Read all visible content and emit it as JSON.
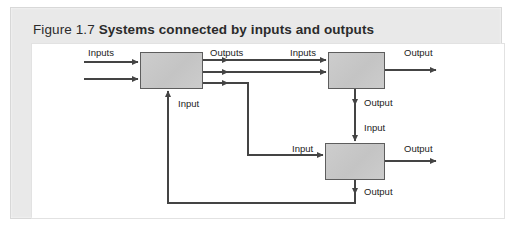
{
  "figure": {
    "number": "Figure 1.7",
    "title": "Systems connected by inputs and outputs",
    "caption_full": "Figure 1.7  Systems connected by inputs and outputs"
  },
  "colors": {
    "panel_background": "#e9e9e9",
    "canvas_background": "#ffffff",
    "box_fill": "#c9c9c9",
    "box_stroke": "#5d5d5d",
    "line_stroke": "#444444",
    "text": "#222222"
  },
  "diagram": {
    "type": "block-flow",
    "nodes": [
      {
        "id": "system-1",
        "label": "",
        "x": 140,
        "y": 52,
        "width": 63,
        "height": 37
      },
      {
        "id": "system-2",
        "label": "",
        "x": 328,
        "y": 52,
        "width": 57,
        "height": 37
      },
      {
        "id": "system-3",
        "label": "",
        "x": 325,
        "y": 143,
        "width": 60,
        "height": 37
      }
    ],
    "labels": [
      {
        "id": "label-inputs-system1",
        "text": "Inputs",
        "x": 88,
        "y": 47
      },
      {
        "id": "label-outputs-system1",
        "text": "Outputs",
        "x": 210,
        "y": 47
      },
      {
        "id": "label-input-system1-bottom",
        "text": "Input",
        "x": 178,
        "y": 98
      },
      {
        "id": "label-inputs-system2",
        "text": "Inputs",
        "x": 290,
        "y": 47
      },
      {
        "id": "label-output-system2-right",
        "text": "Output",
        "x": 404,
        "y": 47
      },
      {
        "id": "label-output-system2-bottom",
        "text": "Output",
        "x": 364,
        "y": 97
      },
      {
        "id": "label-input-system3-top",
        "text": "Input",
        "x": 364,
        "y": 122
      },
      {
        "id": "label-input-system3-left",
        "text": "Input",
        "x": 292,
        "y": 143
      },
      {
        "id": "label-output-system3-right",
        "text": "Output",
        "x": 404,
        "y": 143
      },
      {
        "id": "label-output-system3-bottom",
        "text": "Output",
        "x": 364,
        "y": 186
      }
    ],
    "connections": [
      {
        "id": "conn-inputs-1-upper",
        "from": "external-left",
        "to": "system-1",
        "label": "Inputs"
      },
      {
        "id": "conn-inputs-1-lower",
        "from": "external-left",
        "to": "system-1",
        "label": "Inputs"
      },
      {
        "id": "conn-outputs-1-to-2-upper",
        "from": "system-1",
        "to": "system-2",
        "label": "Outputs / Inputs"
      },
      {
        "id": "conn-outputs-1-to-2-lower",
        "from": "system-1",
        "to": "system-2",
        "label": "Outputs / Inputs"
      },
      {
        "id": "conn-outputs-1-to-3",
        "from": "system-1",
        "to": "system-3",
        "label": "Outputs / Input"
      },
      {
        "id": "conn-2-right-output",
        "from": "system-2",
        "to": "external-right",
        "label": "Output"
      },
      {
        "id": "conn-2-to-3",
        "from": "system-2",
        "to": "system-3",
        "label": "Output / Input"
      },
      {
        "id": "conn-3-right-output",
        "from": "system-3",
        "to": "external-right",
        "label": "Output"
      },
      {
        "id": "conn-3-feedback-to-1",
        "from": "system-3",
        "to": "system-1",
        "label": "Output / Input"
      }
    ]
  }
}
